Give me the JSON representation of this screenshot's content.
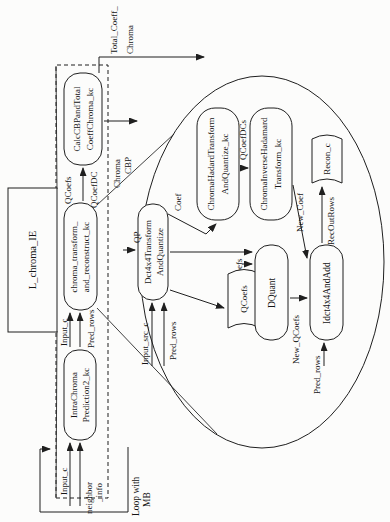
{
  "figure": {
    "paper_color": "#fcfcfb",
    "ink_color": "#1f1f1f",
    "module": "L_chroma_IE",
    "loop_annotation": {
      "line1": "Loop with",
      "line2": "MB"
    },
    "nodes": {
      "intra_chroma_l1": "IntraChroma",
      "intra_chroma_l2": "Prediction2_kc",
      "chroma_transform_l1": "chroma_transform_",
      "chroma_transform_l2": "and_reconstruct_kc",
      "calc_cbp_l1": "CalcCBPandTotal",
      "calc_cbp_l2": "CoeffChroma_kc",
      "dct_l1": "Dct4x4Transform",
      "dct_l2": "AndQuantize",
      "hadamard_l1": "ChromaHadardTransform",
      "hadamard_l2": "AndQuantize_kc",
      "inv_hadamard_l1": "ChromaInverseHadamard",
      "inv_hadamard_l2": "Transform_kc",
      "dquant": "DQuant",
      "idct": "Idct4x4AndAdd",
      "qcoefs_store": "QCoefs",
      "recon_store": "Recon_c"
    },
    "labels": {
      "input_c": "Input_c",
      "neighbor_l1": "neighbor",
      "neighbor_l2": "_info",
      "pred_rows": "Pred_rows",
      "qcoefs": "QCoefs",
      "qcoefdc": "QCoefDC",
      "chroma": "Chroma",
      "cbp": "CBP",
      "total_coeff_l1": "Total_Coeff_",
      "total_coeff_l2": "Chroma",
      "qp": "QP",
      "input_src_c": "Input_src_c",
      "coef": "Coef",
      "qcoefdcs": "QCoefDCs",
      "j_qp": "j_QP",
      "new_qcoefs": "New_QCoefs",
      "new_coef": "New_Coef",
      "recoutrows": "RecOutRows"
    }
  }
}
